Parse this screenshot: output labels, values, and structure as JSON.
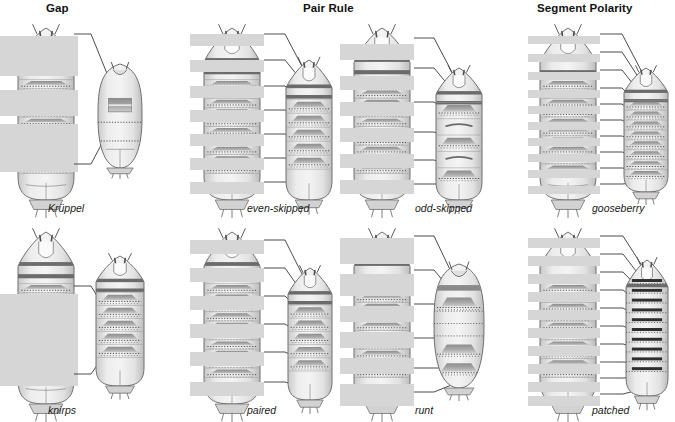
{
  "figure": {
    "title_row": [
      {
        "id": "gap",
        "label": "Gap",
        "x": 46,
        "y": 2
      },
      {
        "id": "pair-rule",
        "label": "Pair Rule",
        "x": 303,
        "y": 2
      },
      {
        "id": "segment-polarity",
        "label": "Segment Polarity",
        "x": 537,
        "y": 2
      }
    ],
    "colors": {
      "expression_band": "#d6d6d6",
      "larva_body": "#e9e9e9",
      "larva_outline": "#6f6f6f",
      "denticle_band": "#9a9a9a",
      "dark_band": "#6b6b6b",
      "pointer_line": "#2b2b2b",
      "background": "#ffffff",
      "title_text": "#111111",
      "label_text": "#1a1a1a"
    },
    "panels": [
      {
        "id": "kruppel",
        "gene": "Krüppel",
        "gene_class": "Gap",
        "label_x": 48,
        "label_y": 202,
        "panel_x": 0,
        "panel_y": 24,
        "wildtype": {
          "x": 18,
          "y": 4,
          "w": 56,
          "h": 172,
          "segments": 11,
          "bands": [
            {
              "y": 8,
              "h": 40
            },
            {
              "y": 62,
              "h": 26
            },
            {
              "y": 96,
              "h": 48
            }
          ],
          "band_x": -18,
          "band_w": 78
        },
        "mutant": {
          "x": 98,
          "y": 40,
          "w": 44,
          "h": 104,
          "type": "short-round",
          "segments": 4
        },
        "pointers": [
          {
            "x1": 74,
            "y1": 10,
            "x2": 108,
            "y2": 52
          },
          {
            "x1": 74,
            "y1": 140,
            "x2": 108,
            "y2": 108
          }
        ]
      },
      {
        "id": "knirps",
        "gene": "knirps",
        "gene_class": "Gap",
        "label_x": 48,
        "label_y": 404,
        "panel_x": 0,
        "panel_y": 228,
        "wildtype": {
          "x": 18,
          "y": 4,
          "w": 56,
          "h": 172,
          "segments": 11,
          "bands": [
            {
              "y": 62,
              "h": 92
            }
          ],
          "band_x": -18,
          "band_w": 78
        },
        "mutant": {
          "x": 96,
          "y": 28,
          "w": 48,
          "h": 130,
          "type": "medium",
          "segments": 6
        },
        "pointers": [
          {
            "x1": 74,
            "y1": 58,
            "x2": 108,
            "y2": 86
          },
          {
            "x1": 74,
            "y1": 146,
            "x2": 108,
            "y2": 122
          }
        ]
      },
      {
        "id": "even-skipped",
        "gene": "even-skipped",
        "gene_class": "Pair Rule",
        "label_x": 247,
        "label_y": 202,
        "panel_x": 186,
        "panel_y": 24,
        "wildtype": {
          "x": 18,
          "y": 4,
          "w": 56,
          "h": 172,
          "segments": 11,
          "bands": [
            {
              "y": 6,
              "h": 12
            },
            {
              "y": 32,
              "h": 12
            },
            {
              "y": 58,
              "h": 12
            },
            {
              "y": 82,
              "h": 12
            },
            {
              "y": 106,
              "h": 12
            },
            {
              "y": 130,
              "h": 12
            },
            {
              "y": 154,
              "h": 12
            }
          ],
          "band_x": -14,
          "band_w": 74
        },
        "mutant": {
          "x": 100,
          "y": 36,
          "w": 46,
          "h": 140,
          "type": "pair-rule",
          "segments": 6
        },
        "pointers": [
          {
            "x1": 78,
            "y1": 10,
            "x2": 120,
            "y2": 50
          },
          {
            "x1": 78,
            "y1": 36,
            "x2": 120,
            "y2": 62
          },
          {
            "x1": 78,
            "y1": 62,
            "x2": 120,
            "y2": 82
          },
          {
            "x1": 78,
            "y1": 86,
            "x2": 120,
            "y2": 104
          },
          {
            "x1": 78,
            "y1": 110,
            "x2": 120,
            "y2": 124
          },
          {
            "x1": 78,
            "y1": 134,
            "x2": 120,
            "y2": 146
          },
          {
            "x1": 78,
            "y1": 158,
            "x2": 120,
            "y2": 166
          }
        ]
      },
      {
        "id": "paired",
        "gene": "paired",
        "gene_class": "Pair Rule",
        "label_x": 247,
        "label_y": 404,
        "panel_x": 186,
        "panel_y": 228,
        "wildtype": {
          "x": 18,
          "y": 4,
          "w": 56,
          "h": 172,
          "segments": 11,
          "bands": [
            {
              "y": 8,
              "h": 14
            },
            {
              "y": 36,
              "h": 14
            },
            {
              "y": 64,
              "h": 14
            },
            {
              "y": 92,
              "h": 14
            },
            {
              "y": 120,
              "h": 14
            },
            {
              "y": 150,
              "h": 14
            }
          ],
          "band_x": -14,
          "band_w": 74
        },
        "mutant": {
          "x": 102,
          "y": 40,
          "w": 44,
          "h": 132,
          "type": "pair-rule",
          "segments": 6
        },
        "pointers": [
          {
            "x1": 78,
            "y1": 12,
            "x2": 120,
            "y2": 54
          },
          {
            "x1": 78,
            "y1": 40,
            "x2": 120,
            "y2": 70
          },
          {
            "x1": 78,
            "y1": 68,
            "x2": 120,
            "y2": 88
          },
          {
            "x1": 78,
            "y1": 96,
            "x2": 120,
            "y2": 110
          },
          {
            "x1": 78,
            "y1": 124,
            "x2": 120,
            "y2": 134
          },
          {
            "x1": 78,
            "y1": 154,
            "x2": 120,
            "y2": 160
          }
        ]
      },
      {
        "id": "odd-skipped",
        "gene": "odd-skipped",
        "gene_class": "Pair Rule",
        "label_x": 415,
        "label_y": 202,
        "panel_x": 336,
        "panel_y": 24,
        "wildtype": {
          "x": 18,
          "y": 4,
          "w": 56,
          "h": 172,
          "segments": 11,
          "bands": [
            {
              "y": 16,
              "h": 16
            },
            {
              "y": 48,
              "h": 14
            },
            {
              "y": 74,
              "h": 14
            },
            {
              "y": 100,
              "h": 14
            },
            {
              "y": 126,
              "h": 14
            },
            {
              "y": 152,
              "h": 14
            }
          ],
          "band_x": -14,
          "band_w": 74
        },
        "mutant": {
          "x": 100,
          "y": 44,
          "w": 46,
          "h": 132,
          "type": "odd-skipped",
          "segments": 5
        },
        "pointers": [
          {
            "x1": 78,
            "y1": 14,
            "x2": 118,
            "y2": 52
          },
          {
            "x1": 78,
            "y1": 44,
            "x2": 118,
            "y2": 68
          },
          {
            "x1": 78,
            "y1": 78,
            "x2": 118,
            "y2": 92
          },
          {
            "x1": 78,
            "y1": 108,
            "x2": 118,
            "y2": 116
          },
          {
            "x1": 78,
            "y1": 136,
            "x2": 118,
            "y2": 142
          },
          {
            "x1": 78,
            "y1": 160,
            "x2": 118,
            "y2": 160
          }
        ]
      },
      {
        "id": "runt",
        "gene": "runt",
        "gene_class": "Pair Rule",
        "label_x": 415,
        "label_y": 404,
        "panel_x": 336,
        "panel_y": 228,
        "wildtype": {
          "x": 18,
          "y": 4,
          "w": 56,
          "h": 172,
          "segments": 11,
          "bands": [
            {
              "y": 6,
              "h": 26
            },
            {
              "y": 42,
              "h": 22
            },
            {
              "y": 74,
              "h": 16
            },
            {
              "y": 100,
              "h": 16
            },
            {
              "y": 126,
              "h": 16
            },
            {
              "y": 152,
              "h": 22
            }
          ],
          "band_x": -14,
          "band_w": 74
        },
        "mutant": {
          "x": 98,
          "y": 36,
          "w": 50,
          "h": 124,
          "type": "runt",
          "segments": 5
        },
        "pointers": [
          {
            "x1": 78,
            "y1": 8,
            "x2": 118,
            "y2": 50
          },
          {
            "x1": 78,
            "y1": 42,
            "x2": 118,
            "y2": 66
          },
          {
            "x1": 78,
            "y1": 76,
            "x2": 118,
            "y2": 92
          },
          {
            "x1": 78,
            "y1": 110,
            "x2": 118,
            "y2": 120
          },
          {
            "x1": 78,
            "y1": 140,
            "x2": 118,
            "y2": 140
          },
          {
            "x1": 78,
            "y1": 164,
            "x2": 118,
            "y2": 156
          }
        ]
      },
      {
        "id": "gooseberry",
        "gene": "gooseberry",
        "gene_class": "Segment Polarity",
        "label_x": 592,
        "label_y": 202,
        "panel_x": 522,
        "panel_y": 24,
        "wildtype": {
          "x": 18,
          "y": 4,
          "w": 56,
          "h": 172,
          "segments": 11,
          "bands": [
            {
              "y": 8,
              "h": 8
            },
            {
              "y": 26,
              "h": 8
            },
            {
              "y": 44,
              "h": 8
            },
            {
              "y": 62,
              "h": 8
            },
            {
              "y": 78,
              "h": 8
            },
            {
              "y": 94,
              "h": 8
            },
            {
              "y": 110,
              "h": 8
            },
            {
              "y": 126,
              "h": 8
            },
            {
              "y": 142,
              "h": 8
            },
            {
              "y": 158,
              "h": 8
            }
          ],
          "band_x": -12,
          "band_w": 72
        },
        "mutant": {
          "x": 102,
          "y": 44,
          "w": 44,
          "h": 124,
          "type": "segment-polarity",
          "segments": 8
        },
        "pointers": [
          {
            "x1": 78,
            "y1": 10,
            "x2": 122,
            "y2": 52
          },
          {
            "x1": 78,
            "y1": 28,
            "x2": 122,
            "y2": 62
          },
          {
            "x1": 78,
            "y1": 46,
            "x2": 122,
            "y2": 74
          },
          {
            "x1": 78,
            "y1": 64,
            "x2": 122,
            "y2": 86
          },
          {
            "x1": 78,
            "y1": 80,
            "x2": 122,
            "y2": 98
          },
          {
            "x1": 78,
            "y1": 96,
            "x2": 122,
            "y2": 110
          },
          {
            "x1": 78,
            "y1": 112,
            "x2": 122,
            "y2": 122
          },
          {
            "x1": 78,
            "y1": 128,
            "x2": 122,
            "y2": 134
          },
          {
            "x1": 78,
            "y1": 144,
            "x2": 122,
            "y2": 146
          },
          {
            "x1": 78,
            "y1": 160,
            "x2": 122,
            "y2": 158
          }
        ]
      },
      {
        "id": "patched",
        "gene": "patched",
        "gene_class": "Segment Polarity",
        "label_x": 592,
        "label_y": 404,
        "panel_x": 522,
        "panel_y": 228,
        "wildtype": {
          "x": 18,
          "y": 4,
          "w": 56,
          "h": 172,
          "segments": 11,
          "bands": [
            {
              "y": 6,
              "h": 10
            },
            {
              "y": 24,
              "h": 10
            },
            {
              "y": 42,
              "h": 10
            },
            {
              "y": 60,
              "h": 10
            },
            {
              "y": 78,
              "h": 10
            },
            {
              "y": 96,
              "h": 10
            },
            {
              "y": 114,
              "h": 10
            },
            {
              "y": 132,
              "h": 10
            },
            {
              "y": 150,
              "h": 10
            },
            {
              "y": 164,
              "h": 10
            }
          ],
          "band_x": -12,
          "band_w": 72
        },
        "mutant": {
          "x": 104,
          "y": 32,
          "w": 42,
          "h": 136,
          "type": "patched",
          "segments": 10
        },
        "pointers": [
          {
            "x1": 78,
            "y1": 8,
            "x2": 124,
            "y2": 44
          },
          {
            "x1": 78,
            "y1": 26,
            "x2": 124,
            "y2": 56
          },
          {
            "x1": 78,
            "y1": 44,
            "x2": 124,
            "y2": 68
          },
          {
            "x1": 78,
            "y1": 62,
            "x2": 124,
            "y2": 80
          },
          {
            "x1": 78,
            "y1": 80,
            "x2": 124,
            "y2": 94
          },
          {
            "x1": 78,
            "y1": 98,
            "x2": 124,
            "y2": 108
          },
          {
            "x1": 78,
            "y1": 116,
            "x2": 124,
            "y2": 122
          },
          {
            "x1": 78,
            "y1": 134,
            "x2": 124,
            "y2": 136
          },
          {
            "x1": 78,
            "y1": 150,
            "x2": 124,
            "y2": 148
          },
          {
            "x1": 78,
            "y1": 166,
            "x2": 124,
            "y2": 160
          }
        ]
      }
    ]
  }
}
